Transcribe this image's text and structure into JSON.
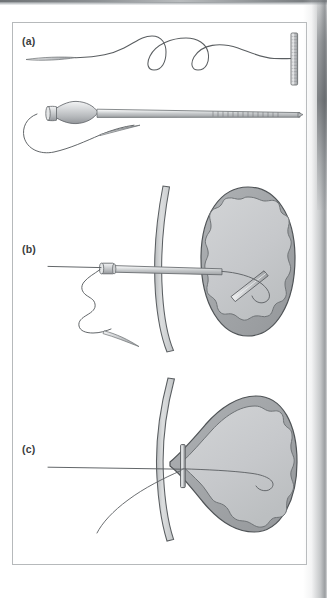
{
  "figure": {
    "frame": {
      "border_color": "#b6b9bb",
      "background": "#ffffff"
    },
    "panels": [
      {
        "id": "a",
        "label": "(a)",
        "caption": "T-fastener anchor with attached suture and delivery needle",
        "parts": [
          {
            "name": "t-bar-anchor",
            "description": "ribbed metal T-bar anchor at distal end of suture"
          },
          {
            "name": "suture-thread",
            "description": "long sinusoidal suture thread"
          },
          {
            "name": "suture-tail",
            "description": "tapered suture tail at proximal end"
          },
          {
            "name": "needle-hub",
            "description": "bulbous tapered hub with collar"
          },
          {
            "name": "needle-shaft",
            "description": "long hollow needle shaft with graduated depth markings"
          },
          {
            "name": "needle-tip",
            "description": "bevelled sharp tip"
          },
          {
            "name": "suture-loop",
            "description": "looped suture trailing from hub"
          }
        ]
      },
      {
        "id": "b",
        "label": "(b)",
        "caption": "Needle advanced through abdominal wall into gastric lumen; anchor deployed",
        "parts": [
          {
            "name": "abdominal-wall",
            "description": "curved layered tissue band"
          },
          {
            "name": "stomach",
            "description": "oval organ with thick wall and wavy mucosal lining"
          },
          {
            "name": "needle-assembly",
            "description": "needle with hub traversing the wall into the organ"
          },
          {
            "name": "deployed-t-bar",
            "description": "T-bar anchor released inside lumen"
          },
          {
            "name": "suture-thread",
            "description": "suture looping back through the needle track"
          },
          {
            "name": "external-suture",
            "description": "zig-zag suture outside the body with bevelled tail"
          }
        ]
      },
      {
        "id": "c",
        "label": "(c)",
        "caption": "Suture drawn taut, apposing stomach wall to abdominal wall",
        "parts": [
          {
            "name": "abdominal-wall",
            "description": "curved layered tissue band"
          },
          {
            "name": "stomach",
            "description": "organ tented and pulled against the wall"
          },
          {
            "name": "seated-t-bar",
            "description": "T-bar anchor seated vertically against the inner wall"
          },
          {
            "name": "taut-suture",
            "description": "straight suture under tension exiting externally"
          },
          {
            "name": "suture-limb",
            "description": "curving free limb of suture"
          }
        ]
      }
    ],
    "colors": {
      "line": "#54585b",
      "line_dark": "#3f4346",
      "organ_outer": "#a3a7aa",
      "organ_inner": "#c8cacc",
      "tissue_band": "#cbced0",
      "metal_light": "#d8dadc",
      "metal_mid": "#b0b3b6",
      "metal_dark": "#8e9194",
      "label_text": "#3a3d40",
      "scan_shadow": "#7e8285"
    }
  }
}
